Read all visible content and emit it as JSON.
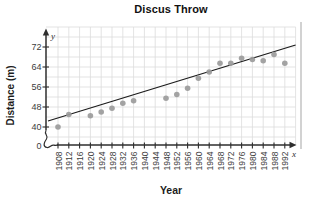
{
  "chart_data": {
    "type": "scatter",
    "title": "Discus Throw",
    "xlabel": "Year",
    "ylabel": "Distance (m)",
    "x_axis_letter": "x",
    "y_axis_letter": "y",
    "origin_label": "0",
    "x_ticks": [
      1908,
      1912,
      1916,
      1920,
      1924,
      1928,
      1932,
      1936,
      1940,
      1944,
      1948,
      1952,
      1956,
      1960,
      1964,
      1968,
      1972,
      1976,
      1980,
      1984,
      1988,
      1992
    ],
    "y_ticks": [
      40,
      48,
      56,
      64,
      72
    ],
    "xlim": [
      1908,
      1992
    ],
    "ylim_shown": [
      40,
      76
    ],
    "axis_break": true,
    "grid": true,
    "points": [
      {
        "year": 1908,
        "distance": 40
      },
      {
        "year": 1912,
        "distance": 45
      },
      {
        "year": 1920,
        "distance": 44.5
      },
      {
        "year": 1924,
        "distance": 46
      },
      {
        "year": 1928,
        "distance": 47.5
      },
      {
        "year": 1932,
        "distance": 49.5
      },
      {
        "year": 1936,
        "distance": 50.5
      },
      {
        "year": 1948,
        "distance": 51.5
      },
      {
        "year": 1952,
        "distance": 53
      },
      {
        "year": 1956,
        "distance": 55.5
      },
      {
        "year": 1960,
        "distance": 59.5
      },
      {
        "year": 1964,
        "distance": 62
      },
      {
        "year": 1968,
        "distance": 65.5
      },
      {
        "year": 1972,
        "distance": 65.5
      },
      {
        "year": 1976,
        "distance": 67.5
      },
      {
        "year": 1980,
        "distance": 67
      },
      {
        "year": 1984,
        "distance": 66.5
      },
      {
        "year": 1988,
        "distance": 69
      },
      {
        "year": 1992,
        "distance": 65.5
      }
    ],
    "trend_line": {
      "from": {
        "year": 1904.3,
        "distance": 42.4
      },
      "to": {
        "year": 1996.0,
        "distance": 72.8
      }
    },
    "colors": {
      "point": "#9b9b9b",
      "trend": "#1c1c1c",
      "grid": "#dcdcdc",
      "axis": "#2e2e2e",
      "tick_text": "#3c3c3c",
      "title_text": "#111111"
    }
  }
}
